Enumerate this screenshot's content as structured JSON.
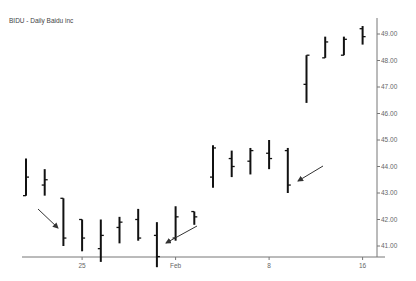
{
  "chart_data": {
    "type": "ohlc",
    "title": "BIDU - Daily  Baidu inc",
    "xlabel": "",
    "ylabel": "",
    "ylim": [
      40.6,
      49.9
    ],
    "y_ticks": [
      "41.00",
      "42.00",
      "43.00",
      "44.00",
      "45.00",
      "46.00",
      "47.00",
      "48.00",
      "49.00"
    ],
    "x_ticks": [
      {
        "label": "25",
        "index": 3
      },
      {
        "label": "Feb",
        "index": 8
      },
      {
        "label": "8",
        "index": 13
      },
      {
        "label": "16",
        "index": 18
      }
    ],
    "grid": false,
    "bars": [
      {
        "open": 42.9,
        "high": 44.3,
        "low": 42.9,
        "close": 43.6
      },
      {
        "open": 43.3,
        "high": 43.9,
        "low": 42.9,
        "close": 43.5
      },
      {
        "open": 42.8,
        "high": 42.8,
        "low": 41.0,
        "close": 41.3
      },
      {
        "open": 42.0,
        "high": 42.0,
        "low": 40.8,
        "close": 41.3
      },
      {
        "open": 40.9,
        "high": 42.0,
        "low": 40.4,
        "close": 41.4
      },
      {
        "open": 41.7,
        "high": 42.1,
        "low": 41.1,
        "close": 41.9
      },
      {
        "open": 42.0,
        "high": 42.4,
        "low": 41.2,
        "close": 41.3
      },
      {
        "open": 41.4,
        "high": 41.9,
        "low": 40.2,
        "close": 40.6
      },
      {
        "open": 41.3,
        "high": 42.5,
        "low": 41.2,
        "close": 42.1
      },
      {
        "open": 42.3,
        "high": 42.3,
        "low": 41.8,
        "close": 42.1
      },
      {
        "open": 43.6,
        "high": 44.8,
        "low": 43.2,
        "close": 44.7
      },
      {
        "open": 44.3,
        "high": 44.6,
        "low": 43.6,
        "close": 44.0
      },
      {
        "open": 44.2,
        "high": 44.7,
        "low": 43.7,
        "close": 44.6
      },
      {
        "open": 44.5,
        "high": 45.0,
        "low": 43.9,
        "close": 44.3
      },
      {
        "open": 44.6,
        "high": 44.7,
        "low": 43.0,
        "close": 43.3
      },
      {
        "open": 47.1,
        "high": 48.2,
        "low": 46.4,
        "close": 48.2
      },
      {
        "open": 48.1,
        "high": 48.9,
        "low": 48.1,
        "close": 48.7
      },
      {
        "open": 48.2,
        "high": 48.9,
        "low": 48.2,
        "close": 48.8
      },
      {
        "open": 49.2,
        "high": 49.3,
        "low": 48.6,
        "close": 48.9
      }
    ],
    "annotations": [
      {
        "type": "arrow",
        "pointing_to_bar": 2
      },
      {
        "type": "arrow",
        "pointing_to_bar": 7
      },
      {
        "type": "arrow",
        "pointing_to_bar": 14
      }
    ]
  }
}
